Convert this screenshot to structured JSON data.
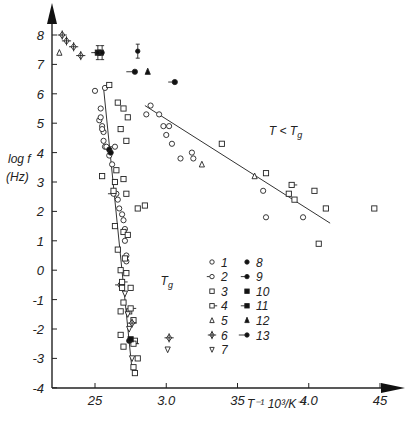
{
  "chart_data": {
    "type": "scatter",
    "title": "",
    "xlabel": "T⁻¹ 10³/K⁻¹",
    "ylabel": "log f (Hz)",
    "ylabel_line1": "log f",
    "ylabel_line2": "(Hz)",
    "xlabel_display": "T⁻¹ 10³/K⁻¹",
    "xlim": [
      2.2,
      4.6
    ],
    "ylim": [
      -4,
      8.6
    ],
    "x_ticks": [
      2.5,
      3.0,
      3.5,
      4.0,
      4.5
    ],
    "x_tick_labels": [
      "25",
      "3.0",
      "35",
      "4.0",
      "45"
    ],
    "y_ticks": [
      8,
      7,
      6,
      5,
      4,
      3,
      2,
      1,
      0,
      -1,
      -2,
      -3,
      -4
    ],
    "y_tick_labels": [
      "8",
      "7",
      "6",
      "5",
      "4",
      "3",
      "2",
      "1",
      "0",
      "-1",
      "-2",
      "-3",
      "-4"
    ],
    "grid": false,
    "annotations": [
      {
        "text": "T < Tg",
        "x": 3.72,
        "y": 4.6
      },
      {
        "text": "Tg",
        "x": 2.96,
        "y": -0.5
      }
    ],
    "fit_lines": [
      {
        "name": "Tg",
        "points": [
          [
            2.56,
            6.2
          ],
          [
            2.76,
            -3.4
          ]
        ]
      },
      {
        "name": "T < Tg",
        "points": [
          [
            2.85,
            5.6
          ],
          [
            4.15,
            1.6
          ]
        ]
      }
    ],
    "legend": [
      {
        "id": "1",
        "marker": "open-circle"
      },
      {
        "id": "2",
        "marker": "open-circle-tail"
      },
      {
        "id": "3",
        "marker": "open-square"
      },
      {
        "id": "4",
        "marker": "open-square-tail"
      },
      {
        "id": "5",
        "marker": "open-triangle-up"
      },
      {
        "id": "6",
        "marker": "open-diamond-cross"
      },
      {
        "id": "7",
        "marker": "open-triangle-down"
      },
      {
        "id": "8",
        "marker": "filled-circle"
      },
      {
        "id": "9",
        "marker": "filled-circle-tail"
      },
      {
        "id": "10",
        "marker": "filled-square"
      },
      {
        "id": "11",
        "marker": "filled-square-tail"
      },
      {
        "id": "12",
        "marker": "filled-triangle-up"
      },
      {
        "id": "13",
        "marker": "filled-circle-tail-long"
      }
    ],
    "legend_position": "lower-center",
    "series": [
      {
        "name": "1",
        "marker": "open-circle",
        "points": [
          [
            2.5,
            6.1
          ],
          [
            2.57,
            6.2
          ],
          [
            2.54,
            5.5
          ],
          [
            2.53,
            5.1
          ],
          [
            2.54,
            5.2
          ],
          [
            2.55,
            4.9
          ],
          [
            2.56,
            4.7
          ],
          [
            2.55,
            4.8
          ],
          [
            2.56,
            4.4
          ],
          [
            2.57,
            4.2
          ],
          [
            2.58,
            4.2
          ],
          [
            2.6,
            3.9
          ],
          [
            2.62,
            3.6
          ],
          [
            2.64,
            3.0
          ],
          [
            2.65,
            2.6
          ],
          [
            2.66,
            2.4
          ],
          [
            2.67,
            2.1
          ],
          [
            2.69,
            1.9
          ],
          [
            2.7,
            1.7
          ],
          [
            2.71,
            1.4
          ],
          [
            2.71,
            1.0
          ],
          [
            2.72,
            0.5
          ],
          [
            2.72,
            0.3
          ],
          [
            2.86,
            5.3
          ],
          [
            2.89,
            5.6
          ],
          [
            2.95,
            5.3
          ],
          [
            2.98,
            4.9
          ],
          [
            3.02,
            4.9
          ],
          [
            3.0,
            4.6
          ],
          [
            3.04,
            4.3
          ],
          [
            3.18,
            4.0
          ],
          [
            3.19,
            3.8
          ],
          [
            3.1,
            3.8
          ],
          [
            3.68,
            2.7
          ],
          [
            3.7,
            1.8
          ],
          [
            3.96,
            1.8
          ]
        ]
      },
      {
        "name": "2",
        "marker": "open-circle-tail",
        "points": [
          [
            2.64,
            4.2
          ],
          [
            2.63,
            2.6
          ],
          [
            2.68,
            -0.5
          ]
        ]
      },
      {
        "name": "3",
        "marker": "open-square",
        "points": [
          [
            2.6,
            6.3
          ],
          [
            2.66,
            5.7
          ],
          [
            2.7,
            5.5
          ],
          [
            2.73,
            5.2
          ],
          [
            2.68,
            4.8
          ],
          [
            2.72,
            4.4
          ],
          [
            2.65,
            3.4
          ],
          [
            2.64,
            3.0
          ],
          [
            2.7,
            3.1
          ],
          [
            2.55,
            3.2
          ],
          [
            2.63,
            2.7
          ],
          [
            2.72,
            2.6
          ],
          [
            2.8,
            2.1
          ],
          [
            2.85,
            2.2
          ],
          [
            2.64,
            1.5
          ],
          [
            2.7,
            1.3
          ],
          [
            2.73,
            1.2
          ],
          [
            2.66,
            0.7
          ],
          [
            2.71,
            0.4
          ],
          [
            2.68,
            0.0
          ],
          [
            2.72,
            -0.1
          ],
          [
            2.69,
            -0.6
          ],
          [
            2.75,
            -0.6
          ],
          [
            2.7,
            -1.1
          ],
          [
            2.68,
            -1.4
          ],
          [
            2.74,
            -1.4
          ],
          [
            2.77,
            -1.7
          ],
          [
            2.68,
            -2.2
          ],
          [
            2.78,
            -2.4
          ],
          [
            2.7,
            -2.6
          ],
          [
            2.8,
            -3.0
          ],
          [
            2.77,
            -3.3
          ],
          [
            2.78,
            -3.5
          ],
          [
            3.39,
            4.3
          ],
          [
            3.7,
            3.3
          ],
          [
            3.86,
            2.6
          ],
          [
            3.9,
            2.4
          ],
          [
            4.04,
            2.7
          ],
          [
            4.12,
            2.1
          ],
          [
            4.46,
            2.1
          ],
          [
            4.07,
            0.9
          ]
        ]
      },
      {
        "name": "4",
        "marker": "open-square-tail",
        "points": [
          [
            2.69,
            -0.4
          ],
          [
            2.75,
            -1.3
          ],
          [
            2.77,
            -2.5
          ],
          [
            3.88,
            2.9
          ]
        ]
      },
      {
        "name": "5",
        "marker": "open-triangle-up",
        "points": [
          [
            2.25,
            7.4
          ],
          [
            3.25,
            3.6
          ],
          [
            3.62,
            3.2
          ]
        ]
      },
      {
        "name": "6",
        "marker": "open-diamond-cross",
        "points": [
          [
            2.27,
            8.0
          ],
          [
            2.3,
            7.8
          ],
          [
            2.35,
            7.6
          ],
          [
            2.4,
            7.3
          ],
          [
            2.76,
            -1.8
          ],
          [
            3.02,
            -2.3
          ]
        ]
      },
      {
        "name": "7",
        "marker": "open-triangle-down",
        "points": [
          [
            2.71,
            -0.8
          ],
          [
            2.73,
            -1.5
          ],
          [
            2.74,
            -2.0
          ],
          [
            2.76,
            -3.0
          ],
          [
            3.01,
            -2.7
          ]
        ]
      },
      {
        "name": "8",
        "marker": "filled-circle",
        "points": [
          [
            2.6,
            4.1
          ],
          [
            2.61,
            4.0
          ],
          [
            2.74,
            -2.4
          ]
        ]
      },
      {
        "name": "9",
        "marker": "filled-circle-tail",
        "points": [
          [
            3.06,
            6.4
          ]
        ]
      },
      {
        "name": "10",
        "marker": "filled-square",
        "points": [
          [
            2.75,
            -2.35
          ]
        ]
      },
      {
        "name": "11",
        "marker": "filled-square-tail",
        "points": [
          [
            2.52,
            7.4
          ],
          [
            2.54,
            7.4
          ]
        ]
      },
      {
        "name": "12",
        "marker": "filled-triangle-up",
        "points": [
          [
            2.87,
            6.75
          ]
        ]
      },
      {
        "name": "13",
        "marker": "filled-circle-tail-long",
        "points": [
          [
            2.78,
            6.75
          ]
        ]
      },
      {
        "name": "error-bar-points",
        "marker": "filled-circle-errorbar",
        "points": [
          [
            2.52,
            7.4
          ],
          [
            2.55,
            7.4
          ],
          [
            2.8,
            7.45
          ]
        ]
      }
    ]
  }
}
